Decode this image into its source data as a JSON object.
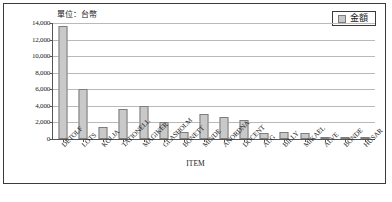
{
  "unit_note": "單位：台幣",
  "legend": {
    "label": "金額",
    "swatch_color": "#c9c9c9"
  },
  "caption": "",
  "chart_data": {
    "type": "bar",
    "title": "",
    "subtitle": "",
    "xlabel": "ITEM",
    "ylabel": "",
    "unit_annotation": "單位：台幣",
    "categories": [
      "DETOLF",
      "LOTS",
      "KOLJA",
      "TATIONELL",
      "MAGIKER",
      "GLASHOLM",
      "BONETT",
      "MINDE",
      "ANORDNA",
      "DOCENT",
      "ALG",
      "BILLY",
      "MIKAEL",
      "ALVE",
      "BONDE",
      "HUSAR"
    ],
    "series": [
      {
        "name": "金額",
        "color": "#c9c9c9",
        "values": [
          13600,
          6000,
          1450,
          3600,
          4000,
          2100,
          850,
          3000,
          2700,
          2250,
          750,
          900,
          760,
          260,
          130,
          150
        ]
      }
    ],
    "ylim": [
      0,
      14000
    ],
    "ytick_values": [
      0,
      2000,
      4000,
      6000,
      8000,
      10000,
      12000,
      14000
    ],
    "ytick_labels": [
      "0",
      "2,000",
      "4,000",
      "6,000",
      "8,000",
      "10,000",
      "12,000",
      "14,000"
    ],
    "grid": true,
    "grid_axis": "y",
    "legend_position": "top-right",
    "xtick_label_rotation": -45
  }
}
